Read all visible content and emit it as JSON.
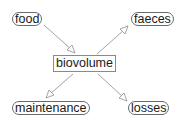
{
  "diagram": {
    "nodes": {
      "food": {
        "label": "food",
        "shape": "rounded"
      },
      "faeces": {
        "label": "faeces",
        "shape": "rounded"
      },
      "biovolume": {
        "label": "biovolume",
        "shape": "rectangle"
      },
      "maintenance": {
        "label": "maintenance",
        "shape": "rounded"
      },
      "losses": {
        "label": "losses",
        "shape": "rounded"
      }
    },
    "edges": [
      {
        "from": "food",
        "to": "biovolume",
        "arrow": "open-triangle"
      },
      {
        "from": "biovolume",
        "to": "faeces",
        "arrow": "open-triangle"
      },
      {
        "from": "biovolume",
        "to": "maintenance",
        "arrow": "open-triangle"
      },
      {
        "from": "biovolume",
        "to": "losses",
        "arrow": "open-triangle"
      }
    ],
    "colors": {
      "edge": "#8c8c8c",
      "node_border": "#6a6a6a",
      "text": "#1a1a1a",
      "background": "#ffffff"
    }
  }
}
